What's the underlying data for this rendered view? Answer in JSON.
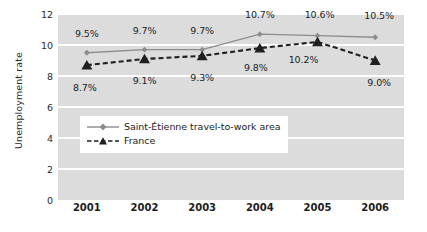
{
  "chart_data": {
    "type": "line",
    "title": "",
    "xlabel": "",
    "ylabel": "Unemployment rate",
    "categories": [
      "2001",
      "2002",
      "2003",
      "2004",
      "2005",
      "2006"
    ],
    "ylim": [
      0,
      12
    ],
    "yticks": [
      "0",
      "2",
      "4",
      "6",
      "8",
      "10",
      "12"
    ],
    "ytick_values": [
      0,
      2,
      4,
      6,
      8,
      10,
      12
    ],
    "grid": true,
    "legend_position": "inside-lower-left",
    "series": [
      {
        "name": "Saint-Étienne travel-to-work area",
        "values": [
          9.5,
          9.7,
          9.7,
          10.7,
          10.6,
          10.5
        ],
        "labels": [
          "9.5%",
          "9.7%",
          "9.7%",
          "10.7%",
          "10.6%",
          "10.5%"
        ],
        "color": "#8c8c8c",
        "style": "solid",
        "marker": "diamond"
      },
      {
        "name": "France",
        "values": [
          8.7,
          9.1,
          9.3,
          9.8,
          10.2,
          9.0
        ],
        "labels": [
          "8.7%",
          "9.1%",
          "9.3%",
          "9.8%",
          "10.2%",
          "9.0%"
        ],
        "color": "#1f1f1f",
        "style": "dashed",
        "marker": "triangle"
      }
    ]
  },
  "legend": {
    "items": [
      {
        "label": "Saint-Étienne travel-to-work area"
      },
      {
        "label": "France"
      }
    ]
  },
  "colors": {
    "plot_background": "#dcdcdc",
    "gridline": "#ffffff",
    "series1": "#8c8c8c",
    "series2": "#1f1f1f",
    "text": "#1c1c1c"
  }
}
